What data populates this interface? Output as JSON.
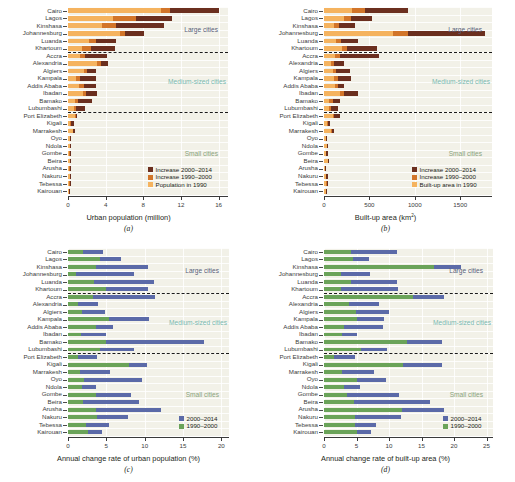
{
  "figure": {
    "cities": [
      "Cairo",
      "Lagos",
      "Kinshasa",
      "Johannesburg",
      "Luanda",
      "Khartoum",
      "Accra",
      "Alexandria",
      "Algiers",
      "Kampala",
      "Addis Ababa",
      "Ibadan",
      "Bamako",
      "Lubumbashi",
      "Port Elizabeth",
      "Kigali",
      "Marrakesh",
      "Oyo",
      "Ndola",
      "Gombe",
      "Beira",
      "Arusha",
      "Nakuru",
      "Tebessa",
      "Kairouan"
    ],
    "groups": [
      {
        "name": "Large cities",
        "label": "Large cities",
        "color": "#5a5f7a",
        "after_index": 5
      },
      {
        "name": "Medium-sized cities",
        "label": "Medium-sized cities",
        "color": "#78b9b0",
        "after_index": 13
      },
      {
        "name": "Small cities",
        "label": "Small cities",
        "color": "#8aa47e",
        "after_index": 24
      }
    ],
    "colors": {
      "increase_2000_2014": "#6b2f1f",
      "increase_1990_2000": "#d2752a",
      "base_1990": "#f5b35f",
      "series_2000_2014": "#5b6aa8",
      "series_1990_2000": "#6aa359",
      "plot_background": "#f2f1e8",
      "grid": "#ffffff"
    }
  },
  "chart_data": [
    {
      "panel": "a",
      "caption": "(a)",
      "type": "bar",
      "stacked": true,
      "orientation": "horizontal",
      "title": "",
      "xlabel": "Urban population (million)",
      "ylabel": "",
      "xlim": [
        0,
        17
      ],
      "xticks": [
        0,
        4,
        8,
        12,
        16
      ],
      "xticklabels": [
        "0",
        "4",
        "8",
        "12",
        "16"
      ],
      "grid": true,
      "legend_position": "bottom-right",
      "categories": [
        "Cairo",
        "Lagos",
        "Kinshasa",
        "Johannesburg",
        "Luanda",
        "Khartoum",
        "Accra",
        "Alexandria",
        "Algiers",
        "Kampala",
        "Addis Ababa",
        "Ibadan",
        "Bamako",
        "Lubumbashi",
        "Port Elizabeth",
        "Kigali",
        "Marrakesh",
        "Oyo",
        "Ndola",
        "Gombe",
        "Beira",
        "Arusha",
        "Nakuru",
        "Tebessa",
        "Kairouan"
      ],
      "series": [
        {
          "name": "Population in 1990",
          "key": "base_1990",
          "color": "#f5b35f",
          "values": [
            9.9,
            4.8,
            3.6,
            5.5,
            2.2,
            1.5,
            1.3,
            3.1,
            1.7,
            0.8,
            1.2,
            1.6,
            0.7,
            0.6,
            0.7,
            0.25,
            0.5,
            0.19,
            0.2,
            0.11,
            0.16,
            0.12,
            0.17,
            0.14,
            0.1
          ]
        },
        {
          "name": "Increase 1990–2000",
          "key": "increase_1990_2000",
          "color": "#d2752a",
          "values": [
            0.9,
            2.4,
            1.5,
            0.6,
            0.8,
            0.9,
            0.5,
            0.4,
            0.3,
            0.5,
            0.5,
            0.3,
            0.4,
            0.3,
            0.1,
            0.08,
            0.08,
            0.05,
            0.04,
            0.05,
            0.04,
            0.05,
            0.04,
            0.03,
            0.02
          ]
        },
        {
          "name": "Increase 2000–2014",
          "key": "increase_2000_2014",
          "color": "#6b2f1f",
          "values": [
            5.2,
            3.9,
            5.1,
            2.0,
            2.1,
            2.6,
            2.3,
            0.8,
            1.0,
            1.7,
            1.3,
            1.2,
            1.4,
            0.9,
            0.15,
            0.33,
            0.13,
            0.13,
            0.09,
            0.16,
            0.11,
            0.17,
            0.1,
            0.05,
            0.04
          ]
        }
      ]
    },
    {
      "panel": "b",
      "caption": "(b)",
      "type": "bar",
      "stacked": true,
      "orientation": "horizontal",
      "title": "",
      "xlabel": "Built-up area (km2)",
      "xlabel_base": "Built-up area (km",
      "xlabel_sup": "2",
      "xlabel_tail": ")",
      "ylabel": "",
      "xlim": [
        0,
        1850
      ],
      "xticks": [
        0,
        500,
        1000,
        1500
      ],
      "xticklabels": [
        "0",
        "500",
        "1000",
        "1500"
      ],
      "grid": true,
      "legend_position": "bottom-right",
      "categories": [
        "Cairo",
        "Lagos",
        "Kinshasa",
        "Johannesburg",
        "Luanda",
        "Khartoum",
        "Accra",
        "Alexandria",
        "Algiers",
        "Kampala",
        "Addis Ababa",
        "Ibadan",
        "Bamako",
        "Lubumbashi",
        "Port Elizabeth",
        "Kigali",
        "Marrakesh",
        "Oyo",
        "Ndola",
        "Gombe",
        "Beira",
        "Arusha",
        "Nakuru",
        "Tebessa",
        "Kairouan"
      ],
      "series": [
        {
          "name": "Built-up area in 1990",
          "key": "base_1990",
          "color": "#f5b35f",
          "values": [
            310,
            215,
            110,
            760,
            135,
            195,
            120,
            75,
            95,
            105,
            120,
            175,
            55,
            55,
            95,
            35,
            75,
            22,
            28,
            22,
            40,
            12,
            22,
            25,
            18
          ]
        },
        {
          "name": "Increase 1990–2000",
          "key": "increase_1990_2000",
          "color": "#d2752a",
          "values": [
            140,
            80,
            55,
            170,
            55,
            55,
            55,
            35,
            40,
            50,
            30,
            45,
            40,
            25,
            20,
            8,
            12,
            5,
            6,
            5,
            6,
            3,
            5,
            4,
            3
          ]
        },
        {
          "name": "Increase 2000–2014",
          "key": "increase_2000_2014",
          "color": "#6b2f1f",
          "values": [
            470,
            230,
            175,
            840,
            180,
            330,
            430,
            105,
            150,
            145,
            65,
            155,
            80,
            70,
            60,
            20,
            20,
            10,
            12,
            16,
            12,
            7,
            13,
            7,
            5
          ]
        }
      ]
    },
    {
      "panel": "c",
      "caption": "(c)",
      "type": "bar",
      "stacked": false,
      "overlaid": true,
      "orientation": "horizontal",
      "title": "",
      "xlabel": "Annual change rate of urban population (%)",
      "ylabel": "",
      "xlim": [
        0,
        21
      ],
      "xticks": [
        0,
        5,
        10,
        15,
        20
      ],
      "xticklabels": [
        "0",
        "5",
        "10",
        "15",
        "20"
      ],
      "grid": true,
      "legend_position": "bottom-right",
      "categories": [
        "Cairo",
        "Lagos",
        "Kinshasa",
        "Johannesburg",
        "Luanda",
        "Khartoum",
        "Accra",
        "Alexandria",
        "Algiers",
        "Kampala",
        "Addis Ababa",
        "Ibadan",
        "Bamako",
        "Lubumbashi",
        "Port Elizabeth",
        "Kigali",
        "Marrakesh",
        "Oyo",
        "Ndola",
        "Gombe",
        "Beira",
        "Arusha",
        "Nakuru",
        "Tebessa",
        "Kairouan"
      ],
      "series": [
        {
          "name": "1990–2000",
          "key": "series_1990_2000",
          "color": "#6aa359",
          "values": [
            2.0,
            4.2,
            3.6,
            1.1,
            3.4,
            4.9,
            3.3,
            1.3,
            1.8,
            5.3,
            3.6,
            1.7,
            5.0,
            4.2,
            1.3,
            7.9,
            1.6,
            2.1,
            1.8,
            3.7,
            1.9,
            3.7,
            3.8,
            2.3,
            2.6
          ]
        },
        {
          "name": "2000–2014",
          "key": "series_2000_2014",
          "color": "#5b6aa8",
          "values": [
            4.6,
            6.9,
            10.4,
            8.6,
            11.2,
            10.4,
            11.3,
            3.9,
            4.8,
            10.5,
            5.9,
            5.0,
            17.8,
            8.6,
            3.8,
            10.3,
            5.5,
            9.6,
            3.7,
            8.2,
            9.2,
            12.1,
            7.8,
            5.3,
            4.4
          ]
        }
      ]
    },
    {
      "panel": "d",
      "caption": "(d)",
      "type": "bar",
      "stacked": false,
      "overlaid": true,
      "orientation": "horizontal",
      "title": "",
      "xlabel": "Annual change rate of built-up area (%)",
      "ylabel": "",
      "xlim": [
        0,
        26
      ],
      "xticks": [
        0,
        5,
        10,
        15,
        20,
        25
      ],
      "xticklabels": [
        "0",
        "5",
        "10",
        "15",
        "20",
        "25"
      ],
      "grid": true,
      "legend_position": "bottom-right",
      "categories": [
        "Cairo",
        "Lagos",
        "Kinshasa",
        "Johannesburg",
        "Luanda",
        "Khartoum",
        "Accra",
        "Alexandria",
        "Algiers",
        "Kampala",
        "Addis Ababa",
        "Ibadan",
        "Bamako",
        "Lubumbashi",
        "Port Elizabeth",
        "Kigali",
        "Marrakesh",
        "Oyo",
        "Ndola",
        "Gombe",
        "Beira",
        "Arusha",
        "Nakuru",
        "Tebessa",
        "Kairouan"
      ],
      "series": [
        {
          "name": "1990–2000",
          "key": "series_1990_2000",
          "color": "#6aa359",
          "values": [
            4.1,
            4.5,
            16.9,
            2.6,
            4.1,
            2.6,
            13.7,
            3.8,
            4.9,
            5.1,
            3.0,
            2.7,
            12.8,
            5.7,
            1.6,
            12.2,
            2.8,
            5.0,
            3.0,
            3.6,
            4.6,
            12.0,
            4.8,
            4.8,
            5.0
          ]
        },
        {
          "name": "2000–2014",
          "key": "series_2000_2014",
          "color": "#5b6aa8",
          "values": [
            11.3,
            6.9,
            21.0,
            7.0,
            11.3,
            11.4,
            18.5,
            8.5,
            10.0,
            9.2,
            9.1,
            5.1,
            18.2,
            9.7,
            4.8,
            18.2,
            7.7,
            9.5,
            5.6,
            11.5,
            16.3,
            18.5,
            11.9,
            8.0,
            7.2
          ]
        }
      ]
    }
  ]
}
